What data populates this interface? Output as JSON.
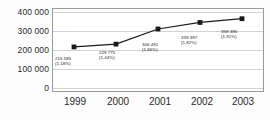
{
  "chart_data": {
    "type": "line",
    "title": "",
    "subtitle": "",
    "xlabel": "",
    "ylabel": "",
    "categories": [
      "1999",
      "2000",
      "2001",
      "2002",
      "2003"
    ],
    "x_tick_labels": [
      "1999",
      "2000",
      "2001",
      "2002",
      "2003"
    ],
    "y_tick_labels": [
      "400 000",
      "300 000",
      "200 000",
      "100 000",
      "0"
    ],
    "y_tick_values": [
      400000,
      300000,
      200000,
      100000,
      0
    ],
    "ylim": [
      0,
      400000
    ],
    "grid": true,
    "grid_orientation": "horizontal",
    "legend": false,
    "legend_position": "none",
    "marker": "square",
    "series": [
      {
        "name": "series-1",
        "color": "#1a1a1a",
        "marker_color": "#1a1a1a",
        "values": [
          215585,
          229775,
          306491,
          339397,
          358486
        ],
        "point_labels": [
          {
            "value": "215 585",
            "pct": "(1,18%)"
          },
          {
            "value": "229 775",
            "pct": "(1,44%)"
          },
          {
            "value": "306 491",
            "pct": "(1,66%)"
          },
          {
            "value": "339 397",
            "pct": "(1,82%)"
          },
          {
            "value": "358 486",
            "pct": "(1,91%)"
          }
        ]
      }
    ],
    "colors": {
      "line": "#1a1a1a",
      "marker": "#1a1a1a",
      "grid": "#d3d3d3",
      "axis_border": "#9a9a9a",
      "plot_background": "#ffffff",
      "page_background": "#fdfdfd",
      "tick_text": "#2b2b2b",
      "label_text": "#1a1a1a"
    }
  }
}
